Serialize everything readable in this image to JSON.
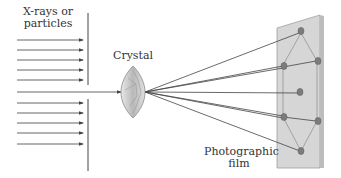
{
  "diagram": {
    "labels": {
      "source_line1": "X-rays or",
      "source_line2": "particles",
      "crystal": "Crystal",
      "film_line1": "Photographic",
      "film_line2": "film"
    },
    "colors": {
      "lines": "#555555",
      "film": "#d4d4d4",
      "film_edge": "#9a9a9a",
      "spot": "#7a7a7a",
      "crystal": "#c8c8c8"
    }
  }
}
